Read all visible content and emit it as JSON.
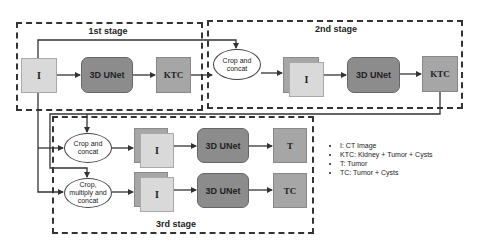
{
  "stages": {
    "stage1": {
      "label": "1st stage"
    },
    "stage2": {
      "label": "2nd stage"
    },
    "stage3": {
      "label": "3rd stage"
    }
  },
  "nodes": {
    "s1_input": "I",
    "s1_unet": "3D UNet",
    "s1_output": "KTC",
    "s2_crop": "Crop and concat",
    "s2_input": "I",
    "s2_unet": "3D UNet",
    "s2_output": "KTC",
    "s3a_crop": "Crop and concat",
    "s3a_input": "I",
    "s3a_unet": "3D UNet",
    "s3a_output": "T",
    "s3b_crop": "Crop, multiply and concat",
    "s3b_input": "I",
    "s3b_unet": "3D UNet",
    "s3b_output": "TC"
  },
  "legend": {
    "items": [
      "I: CT Image",
      "KTC: Kidney + Tumor + Cysts",
      "T: Tumor",
      "TC: Tumor + Cysts"
    ]
  },
  "colors": {
    "input_fill": "#d9d9d9",
    "unet_fill": "#8c8c8c",
    "output_fill": "#a6a6a6",
    "line": "#333333"
  }
}
